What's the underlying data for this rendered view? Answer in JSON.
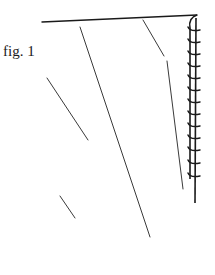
{
  "figure": {
    "label": "fig. 1",
    "ink_color": "#1a1a1a",
    "line_color": "#3a3a3a",
    "background": "#ffffff"
  },
  "drawing": {
    "top_line": {
      "x1": 42,
      "y1": 22,
      "x2": 197,
      "y2": 15
    },
    "ladder": {
      "left_x": 190,
      "right_x": 196,
      "top_y": 18,
      "bottom_y": 203,
      "rung_ys": [
        30,
        42,
        54,
        66,
        78,
        90,
        102,
        114,
        126,
        138,
        150,
        163,
        176
      ]
    },
    "diagonals": [
      {
        "name": "right-diagonal-upper",
        "x1": 143,
        "y1": 20,
        "x2": 164,
        "y2": 56
      },
      {
        "name": "right-diagonal-lower",
        "x1": 167,
        "y1": 61,
        "x2": 183,
        "y2": 189
      },
      {
        "name": "middle-diagonal",
        "x1": 80,
        "y1": 27,
        "x2": 150,
        "y2": 237
      },
      {
        "name": "left-diagonal",
        "x1": 47,
        "y1": 78,
        "x2": 88,
        "y2": 140
      },
      {
        "name": "short-stub",
        "x1": 60,
        "y1": 196,
        "x2": 75,
        "y2": 218
      }
    ]
  }
}
